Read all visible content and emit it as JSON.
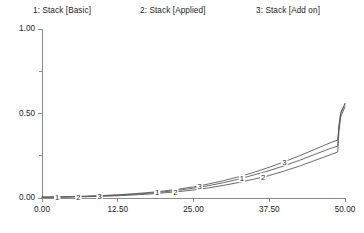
{
  "chart_data": {
    "type": "line",
    "title": "",
    "subtitle": "",
    "xlabel": "",
    "ylabel": "",
    "xlim": [
      0,
      50
    ],
    "ylim": [
      0,
      1
    ],
    "grid": false,
    "legend_position": "top",
    "x_ticks": [
      "0.00",
      "12.50",
      "25.00",
      "37.50",
      "50.00"
    ],
    "x_tick_values": [
      0,
      12.5,
      25,
      37.5,
      50
    ],
    "y_ticks": [
      "0.00",
      "0.50",
      "1.00"
    ],
    "y_tick_values": [
      0,
      0.5,
      1
    ],
    "y_minor_tick_values": [
      0.25,
      0.75
    ],
    "line_color": "#5a5a5a",
    "axis_color": "#8a8a8a",
    "series": [
      {
        "name": "1: Stack [Basic]",
        "marker": "1",
        "marker_x": [
          2.5,
          19.0,
          33.0
        ],
        "x": [
          0,
          2.5,
          5,
          7.5,
          10,
          12.5,
          15,
          17.5,
          19,
          20,
          22.5,
          25,
          27.5,
          30,
          32,
          33,
          35,
          37.5,
          40,
          42.5,
          45,
          47,
          48,
          48.8,
          49.0,
          49.3,
          50
        ],
        "values": [
          0.005,
          0.006,
          0.008,
          0.01,
          0.013,
          0.017,
          0.022,
          0.028,
          0.033,
          0.036,
          0.046,
          0.058,
          0.073,
          0.091,
          0.108,
          0.117,
          0.137,
          0.162,
          0.191,
          0.223,
          0.258,
          0.285,
          0.298,
          0.308,
          0.42,
          0.5,
          0.556
        ]
      },
      {
        "name": "2: Stack [Applied]",
        "marker": "2",
        "marker_x": [
          6.0,
          22.0,
          36.5
        ],
        "x": [
          0,
          2.5,
          5,
          6,
          7.5,
          10,
          12.5,
          15,
          17.5,
          20,
          22,
          25,
          27.5,
          30,
          32.5,
          35,
          36.5,
          37.5,
          40,
          42.5,
          45,
          47,
          48,
          48.8,
          49.0,
          49.3,
          50
        ],
        "values": [
          0.004,
          0.005,
          0.006,
          0.007,
          0.008,
          0.01,
          0.013,
          0.018,
          0.023,
          0.03,
          0.036,
          0.047,
          0.06,
          0.075,
          0.092,
          0.112,
          0.124,
          0.133,
          0.16,
          0.189,
          0.222,
          0.248,
          0.262,
          0.272,
          0.395,
          0.48,
          0.54
        ]
      },
      {
        "name": "3: Stack [Add on]",
        "marker": "3",
        "marker_x": [
          9.5,
          26.0,
          40.0
        ],
        "x": [
          0,
          2.5,
          5,
          7.5,
          9.5,
          12.5,
          15,
          17.5,
          20,
          22.5,
          25,
          26,
          27.5,
          30,
          32.5,
          35,
          37.5,
          40,
          42.5,
          45,
          47,
          48,
          48.8,
          49.0,
          49.3,
          50
        ],
        "values": [
          0.005,
          0.006,
          0.008,
          0.011,
          0.014,
          0.019,
          0.025,
          0.032,
          0.041,
          0.052,
          0.066,
          0.072,
          0.083,
          0.103,
          0.126,
          0.152,
          0.182,
          0.215,
          0.25,
          0.288,
          0.318,
          0.333,
          0.343,
          0.43,
          0.505,
          0.56
        ]
      }
    ]
  }
}
